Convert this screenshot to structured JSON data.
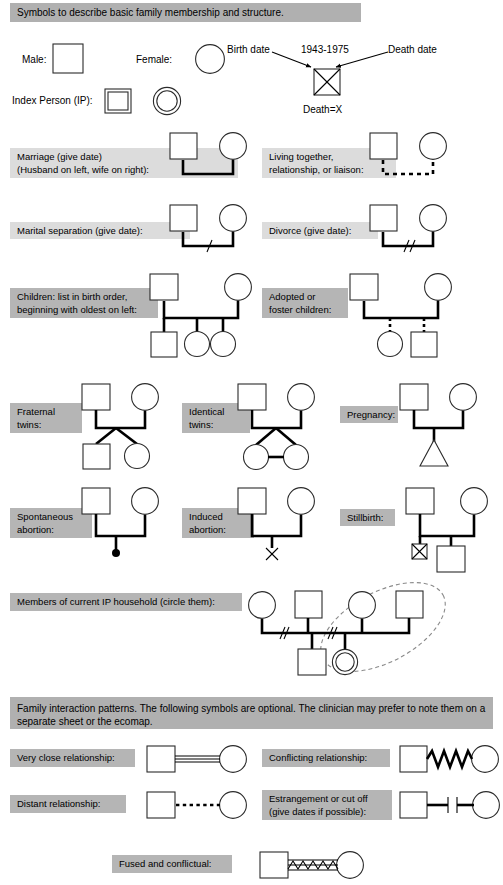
{
  "page": {
    "band_color": "#b5b5b5",
    "band_color_light": "#dcdcdc",
    "line_color": "#000000",
    "shape_fill": "#ffffff",
    "household_circle_color": "#8a8a8a"
  },
  "section_basic": {
    "header": "Symbols to describe basic family membership and structure.",
    "male_label": "Male:",
    "female_label": "Female:",
    "index_person_label": "Index Person (IP):",
    "birth_date_label": "Birth date",
    "death_date_label": "Death date",
    "dates_value": "1943-1975",
    "death_equals_label": "Death=X"
  },
  "rows": [
    {
      "id": "marriage",
      "label": "Marriage (give date)\n(Husband on left, wife on right):",
      "symbol": "couple-married"
    },
    {
      "id": "living-together",
      "label": "Living together,\nrelationship, or liaison:",
      "symbol": "couple-dashed"
    },
    {
      "id": "marital-separation",
      "label": "Marital separation (give date):",
      "symbol": "couple-one-slash"
    },
    {
      "id": "divorce",
      "label": "Divorce (give date):",
      "symbol": "couple-two-slash"
    },
    {
      "id": "children",
      "label": "Children: list in birth order,\nbeginning with oldest on left:",
      "symbol": "children-three"
    },
    {
      "id": "adopted",
      "label": "Adopted or\nfoster children:",
      "symbol": "children-adopted"
    },
    {
      "id": "fraternal-twins",
      "label": "Fraternal\ntwins:",
      "symbol": "twins-fraternal"
    },
    {
      "id": "identical-twins",
      "label": "Identical\ntwins:",
      "symbol": "twins-identical"
    },
    {
      "id": "pregnancy",
      "label": "Pregnancy:",
      "symbol": "pregnancy-triangle"
    },
    {
      "id": "spontaneous-abortion",
      "label": "Spontaneous\nabortion:",
      "symbol": "abortion-dot"
    },
    {
      "id": "induced-abortion",
      "label": "Induced\nabortion:",
      "symbol": "abortion-x"
    },
    {
      "id": "stillbirth",
      "label": "Stillbirth:",
      "symbol": "stillbirth-box"
    },
    {
      "id": "ip-household",
      "label": "Members of current IP household (circle them):",
      "symbol": "household-circle"
    }
  ],
  "section_interaction": {
    "header": "Family interaction patterns.  The following symbols are optional.  The clinician may prefer to note them on a separate sheet or the ecomap.",
    "items": [
      {
        "id": "very-close",
        "label": "Very close relationship:",
        "symbol": "triple-line"
      },
      {
        "id": "conflicting",
        "label": "Conflicting relationship:",
        "symbol": "zigzag-line"
      },
      {
        "id": "distant",
        "label": "Distant relationship:",
        "symbol": "dotted-line"
      },
      {
        "id": "estrangement",
        "label": "Estrangement or cut off\n(give dates if possible):",
        "symbol": "cutoff-bars"
      },
      {
        "id": "fused",
        "label": "Fused and conflictual:",
        "symbol": "triple-zigzag"
      }
    ]
  }
}
